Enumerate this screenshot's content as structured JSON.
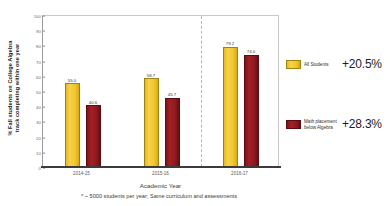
{
  "chart_data": {
    "type": "bar",
    "title": "",
    "categories": [
      "2014-15",
      "2015-16",
      "2016-17"
    ],
    "series": [
      {
        "name": "All Students",
        "color": "#F2C62E",
        "values": [
          55.0,
          58.7,
          79.2
        ],
        "value_labels": [
          "55.0",
          "58.7",
          "79.2"
        ],
        "delta_label": "+20.5%"
      },
      {
        "name": "Math placement below Algebra",
        "name_line1": "Math placement",
        "name_line2": "below Algebra",
        "color": "#8E1A20",
        "values": [
          40.6,
          45.7,
          74.0
        ],
        "value_labels": [
          "40.6",
          "45.7",
          "74.0"
        ],
        "delta_label": "+28.3%"
      }
    ],
    "xlabel": "Academic Year",
    "ylabel": "% Fall students on College Algebra track completing within one year",
    "ylabel_line1": "% Fall students on College Algebra",
    "ylabel_line2": "track completing within one year",
    "ylim": [
      0,
      100
    ],
    "yticks": [
      0,
      10,
      20,
      30,
      40,
      50,
      60,
      70,
      80,
      90,
      100
    ],
    "ytick_labels": [
      "0",
      "10",
      "20",
      "30",
      "40",
      "50",
      "60",
      "70",
      "80",
      "90",
      "100"
    ],
    "grid": false,
    "legend_position": "right",
    "annotations": [
      {
        "name": "group-separator",
        "type": "vertical-dashed-line",
        "between_categories": [
          "2015-16",
          "2016-17"
        ]
      }
    ],
    "footnote": "* ~ 5000 students per year; Same curriculum and assessments"
  }
}
